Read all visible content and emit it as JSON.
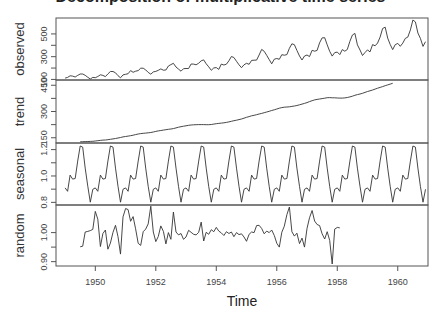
{
  "chart_data": {
    "type": "line",
    "title": "Decomposition of multiplicative time series",
    "xlabel": "Time",
    "x_ticks": [
      1950,
      1952,
      1954,
      1956,
      1958,
      1960
    ],
    "x_range": [
      1948.7,
      1961.0
    ],
    "grid": false,
    "panels": [
      {
        "name": "observed",
        "ylabel": "observed",
        "y_ticks": [
          100,
          300,
          500
        ],
        "y_tick_labels": [
          "100",
          "300",
          "500"
        ],
        "ylim": [
          95,
          640
        ],
        "start": 1949.0,
        "frequency": 12,
        "values": [
          112,
          118,
          132,
          129,
          121,
          135,
          148,
          148,
          136,
          119,
          104,
          118,
          115,
          126,
          141,
          135,
          125,
          149,
          170,
          170,
          158,
          133,
          114,
          140,
          145,
          150,
          178,
          163,
          172,
          178,
          199,
          199,
          184,
          162,
          146,
          166,
          171,
          180,
          193,
          181,
          183,
          218,
          230,
          242,
          209,
          191,
          172,
          194,
          196,
          196,
          236,
          235,
          229,
          243,
          264,
          272,
          237,
          211,
          180,
          201,
          204,
          188,
          235,
          227,
          234,
          264,
          302,
          293,
          259,
          229,
          203,
          229,
          242,
          233,
          267,
          269,
          270,
          315,
          364,
          347,
          312,
          274,
          237,
          278,
          284,
          277,
          317,
          313,
          318,
          374,
          413,
          405,
          355,
          306,
          271,
          306,
          315,
          301,
          356,
          348,
          355,
          422,
          465,
          467,
          404,
          347,
          305,
          336,
          340,
          318,
          362,
          348,
          363,
          435,
          491,
          505,
          404,
          359,
          310,
          337,
          360,
          342,
          406,
          396,
          420,
          472,
          548,
          559,
          463,
          407,
          362,
          405,
          417,
          391,
          419,
          461,
          472,
          535,
          622,
          606,
          508,
          461,
          390,
          432
        ]
      },
      {
        "name": "trend",
        "ylabel": "trend",
        "y_ticks": [
          150,
          300,
          450
        ],
        "y_tick_labels": [
          "150",
          "300",
          "450"
        ],
        "ylim": [
          120,
          480
        ],
        "start": 1949.5,
        "frequency": 12,
        "values": [
          126.8,
          127.25,
          127.96,
          128.58,
          129.0,
          129.75,
          131.25,
          133.08,
          134.92,
          136.42,
          137.42,
          138.75,
          140.92,
          143.17,
          145.71,
          148.42,
          151.54,
          154.71,
          157.12,
          159.54,
          161.83,
          164.75,
          168.21,
          171.21,
          173.58,
          175.46,
          176.83,
          178.04,
          180.17,
          183.12,
          186.21,
          189.04,
          191.29,
          193.58,
          195.83,
          198.04,
          199.75,
          202.21,
          206.25,
          210.42,
          213.38,
          215.83,
          218.5,
          220.92,
          222.92,
          224.08,
          224.71,
          225.33,
          225.33,
          224.96,
          224.58,
          224.46,
          225.54,
          228.0,
          230.46,
          232.25,
          233.92,
          235.62,
          237.75,
          240.5,
          243.96,
          247.17,
          250.25,
          253.5,
          257.12,
          261.83,
          266.67,
          271.12,
          275.21,
          278.5,
          281.96,
          285.75,
          289.33,
          293.25,
          297.17,
          301.0,
          305.46,
          309.96,
          314.42,
          318.62,
          322.38,
          324.5,
          325.5,
          326.83,
          329.0,
          331.25,
          334.25,
          338.0,
          342.25,
          346.42,
          351.12,
          356.5,
          361.5,
          366.25,
          369.25,
          371.42,
          373.75,
          376.12,
          379.0,
          379.5,
          378.46,
          378.0,
          377.17,
          376.42,
          376.75,
          377.5,
          379.75,
          383.67,
          387.5,
          392.33,
          396.58,
          399.83,
          404.0,
          409.33,
          414.42,
          418.33,
          422.75,
          428.08,
          433.0,
          437.75,
          442.25,
          447.38,
          452.04,
          456.67,
          461.0
        ]
      },
      {
        "name": "seasonal",
        "ylabel": "seasonal",
        "y_ticks": [
          0.8,
          1.0,
          1.2
        ],
        "y_tick_labels": [
          "0.8",
          "1.0",
          "1.2"
        ],
        "ylim": [
          0.78,
          1.25
        ],
        "start": 1949.0,
        "frequency": 12,
        "one_cycle": [
          0.91,
          0.884,
          1.007,
          0.976,
          0.981,
          1.113,
          1.227,
          1.219,
          1.06,
          0.922,
          0.801,
          0.899
        ]
      },
      {
        "name": "random",
        "ylabel": "random",
        "y_ticks": [
          0.9,
          1.0
        ],
        "y_tick_labels": [
          "0.90",
          "1.00"
        ],
        "ylim": [
          0.885,
          1.095
        ],
        "start": 1949.5,
        "frequency": 12,
        "values": [
          0.951,
          0.953,
          1.002,
          1.004,
          1.007,
          1.011,
          1.073,
          1.046,
          0.952,
          0.997,
          1.009,
          0.943,
          0.964,
          1.001,
          1.025,
          0.986,
          0.926,
          1.054,
          1.083,
          1.079,
          1.039,
          1.055,
          1.013,
          0.963,
          0.956,
          1.003,
          1.012,
          1.03,
          1.091,
          1.002,
          0.969,
          0.987,
          1.023,
          1.004,
          0.961,
          1.0,
          0.977,
          1.071,
          1.002,
          0.992,
          0.997,
          0.977,
          0.985,
          1.008,
          1.001,
          0.994,
          0.992,
          1.001,
          1.036,
          0.971,
          1.001,
          0.994,
          1.01,
          1.003,
          1.018,
          1.005,
          0.999,
          0.99,
          1.003,
          0.997,
          1.002,
          0.986,
          1.0,
          0.993,
          0.996,
          0.985,
          0.97,
          0.994,
          1.002,
          1.0,
          1.024,
          1.025,
          1.014,
          0.996,
          1.005,
          1.0,
          1.009,
          0.99,
          0.963,
          0.95,
          1.001,
          1.022,
          1.062,
          1.088,
          1.003,
          0.988,
          0.998,
          0.962,
          0.981,
          0.95,
          1.014,
          1.051,
          1.076,
          1.04,
          1.028,
          1.024,
          0.996,
          0.978,
          1.003,
          0.973,
          0.892,
          1.012,
          1.018,
          1.016
        ]
      }
    ]
  }
}
